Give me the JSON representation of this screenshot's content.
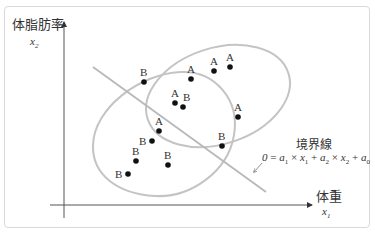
{
  "diagram": {
    "y_axis": {
      "title": "体脂肪率",
      "var": "x",
      "sub": "2"
    },
    "x_axis": {
      "title": "体重",
      "var": "x",
      "sub": "1"
    },
    "boundary": {
      "title": "境界線",
      "equation": "0 = a₁ × x₁ + a₂ × x₂ + a₀"
    },
    "points": [
      {
        "label": "B",
        "x": 144,
        "y": 82
      },
      {
        "label": "A",
        "x": 191,
        "y": 79
      },
      {
        "label": "A",
        "x": 214,
        "y": 71
      },
      {
        "label": "A",
        "x": 230,
        "y": 67
      },
      {
        "label": "A",
        "x": 175,
        "y": 103
      },
      {
        "label": "B",
        "x": 183,
        "y": 107
      },
      {
        "label": "A",
        "x": 238,
        "y": 117
      },
      {
        "label": "A",
        "x": 159,
        "y": 131
      },
      {
        "label": "B",
        "x": 152,
        "y": 141
      },
      {
        "label": "B",
        "x": 222,
        "y": 146
      },
      {
        "label": "B",
        "x": 136,
        "y": 161
      },
      {
        "label": "B",
        "x": 168,
        "y": 165
      },
      {
        "label": "B",
        "x": 128,
        "y": 174
      }
    ],
    "colors": {
      "ellipse": "#c0c0c0",
      "line": "#b8b8b8",
      "axis": "#555555",
      "point": "#111111"
    }
  }
}
